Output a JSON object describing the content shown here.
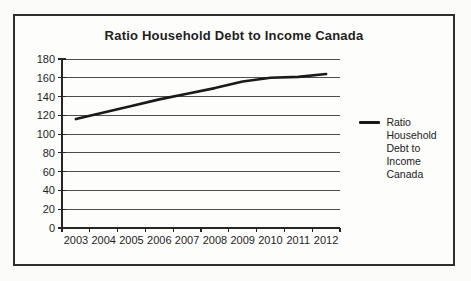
{
  "chart_data": {
    "type": "line",
    "title": "Ratio Household Debt to Income Canada",
    "categories": [
      "2003",
      "2004",
      "2005",
      "2006",
      "2007",
      "2008",
      "2009",
      "2010",
      "2011",
      "2012"
    ],
    "series": [
      {
        "name": "Ratio Household Debt to Income Canada",
        "values": [
          116,
          123,
          130,
          137,
          143,
          149,
          156,
          160,
          161,
          164
        ]
      }
    ],
    "xlabel": "",
    "ylabel": "",
    "ylim": [
      0,
      180
    ],
    "yticks": [
      0,
      20,
      40,
      60,
      80,
      100,
      120,
      140,
      160,
      180
    ],
    "grid": "horizontal gridlines on",
    "legend_position": "right",
    "legend_label": "Ratio Household\nDebt to Income\nCanada",
    "colors": {
      "line": "#1a1a1a",
      "grid": "#4d4d4d",
      "axis": "#262626",
      "text": "#1f1f1f",
      "frame_border": "#2e2e2e",
      "background": "#fbfbfa"
    }
  }
}
